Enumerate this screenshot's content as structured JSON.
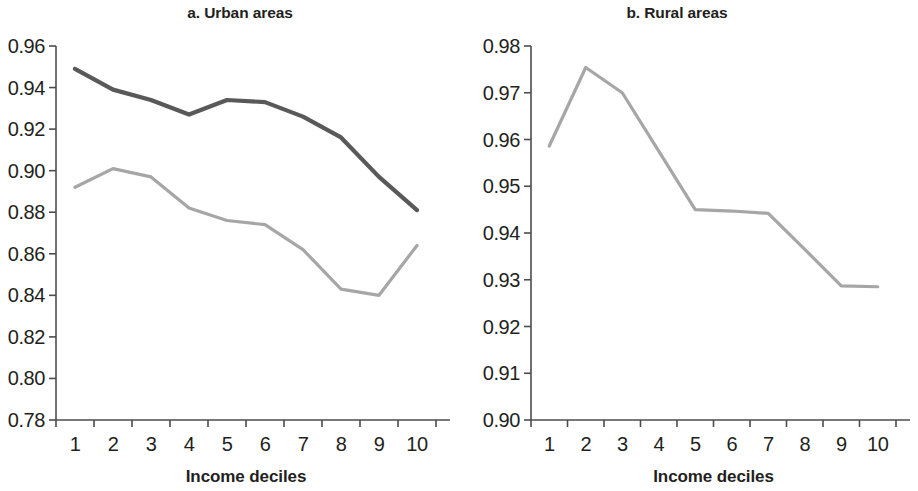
{
  "figure": {
    "background": "#ffffff",
    "panels": [
      {
        "id": "a",
        "title": "a. Urban areas",
        "xlabel": "Income deciles"
      },
      {
        "id": "b",
        "title": "b. Rural areas",
        "xlabel": "Income deciles"
      }
    ]
  },
  "chart_data": [
    {
      "type": "line",
      "title": "a. Urban areas",
      "xlabel": "Income deciles",
      "ylabel": "",
      "categories": [
        "1",
        "2",
        "3",
        "4",
        "5",
        "6",
        "7",
        "8",
        "9",
        "10"
      ],
      "x": [
        1,
        2,
        3,
        4,
        5,
        6,
        7,
        8,
        9,
        10
      ],
      "xlim": [
        0.5,
        10.5
      ],
      "ylim": [
        0.78,
        0.96
      ],
      "yticks": [
        "0.96",
        "0.94",
        "0.92",
        "0.90",
        "0.88",
        "0.86",
        "0.84",
        "0.82",
        "0.80",
        "0.78"
      ],
      "ytick_values": [
        0.96,
        0.94,
        0.92,
        0.9,
        0.88,
        0.86,
        0.84,
        0.82,
        0.8,
        0.78
      ],
      "xticks": [
        "1",
        "2",
        "3",
        "4",
        "5",
        "6",
        "7",
        "8",
        "9",
        "10"
      ],
      "grid": false,
      "legend": "none",
      "series": [
        {
          "name": "upper-dark-line",
          "color": "#595959",
          "values": [
            0.949,
            0.939,
            0.934,
            0.927,
            0.934,
            0.933,
            0.926,
            0.916,
            0.897,
            0.881
          ]
        },
        {
          "name": "lower-light-line",
          "color": "#a6a6a6",
          "values": [
            0.892,
            0.901,
            0.897,
            0.882,
            0.876,
            0.874,
            0.862,
            0.843,
            0.84,
            0.864
          ]
        }
      ]
    },
    {
      "type": "line",
      "title": "b. Rural areas",
      "xlabel": "Income deciles",
      "ylabel": "",
      "categories": [
        "1",
        "2",
        "3",
        "4",
        "5",
        "6",
        "7",
        "8",
        "9",
        "10"
      ],
      "x": [
        1,
        2,
        3,
        4,
        5,
        6,
        7,
        8,
        9,
        10
      ],
      "xlim": [
        0.5,
        10.5
      ],
      "ylim": [
        0.9,
        0.98
      ],
      "yticks": [
        "0.98",
        "0.97",
        "0.96",
        "0.95",
        "0.94",
        "0.93",
        "0.92",
        "0.91",
        "0.90"
      ],
      "ytick_values": [
        0.98,
        0.97,
        0.96,
        0.95,
        0.94,
        0.93,
        0.92,
        0.91,
        0.9
      ],
      "xticks": [
        "1",
        "2",
        "3",
        "4",
        "5",
        "6",
        "7",
        "8",
        "9",
        "10"
      ],
      "grid": false,
      "legend": "none",
      "series": [
        {
          "name": "rural-line",
          "color": "#a6a6a6",
          "values": [
            0.9586,
            0.9754,
            0.97,
            0.9575,
            0.945,
            0.9447,
            0.9442,
            0.9365,
            0.9287,
            0.9285
          ]
        }
      ]
    }
  ]
}
